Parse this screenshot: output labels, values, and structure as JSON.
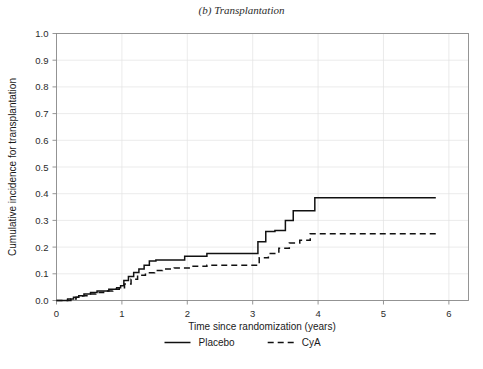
{
  "figure": {
    "title": "(b) Transplantation",
    "background": "#ffffff"
  },
  "chart_data": {
    "type": "line",
    "title": "(b) Transplantation",
    "xlabel": "Time since randomization (years)",
    "ylabel": "Cumulative incidence for transplantation",
    "xlim": [
      0,
      6.3
    ],
    "ylim": [
      0,
      1.0
    ],
    "xticks": [
      0,
      1,
      2,
      3,
      4,
      5,
      6
    ],
    "xtick_labels": [
      "0",
      "1",
      "2",
      "3",
      "4",
      "5",
      "6"
    ],
    "yticks": [
      0.0,
      0.1,
      0.2,
      0.3,
      0.4,
      0.5,
      0.6,
      0.7,
      0.8,
      0.9,
      1.0
    ],
    "ytick_labels": [
      "0.0",
      "0.1",
      "0.2",
      "0.3",
      "0.4",
      "0.5",
      "0.6",
      "0.7",
      "0.8",
      "0.9",
      "1.0"
    ],
    "grid": true,
    "grid_color": "#e3e3e3",
    "legend_position": "bottom",
    "step_type": "post",
    "series": [
      {
        "name": "Placebo",
        "style": "solid",
        "color": "#111111",
        "dasharray": "",
        "x": [
          0.0,
          0.17,
          0.26,
          0.34,
          0.42,
          0.52,
          0.62,
          0.7,
          0.8,
          0.92,
          0.98,
          1.03,
          1.1,
          1.18,
          1.26,
          1.34,
          1.42,
          1.52,
          1.86,
          1.96,
          2.22,
          2.3,
          3.02,
          3.08,
          3.2,
          3.34,
          3.5,
          3.62,
          3.95,
          5.8
        ],
        "y": [
          0.0,
          0.006,
          0.012,
          0.018,
          0.024,
          0.03,
          0.036,
          0.036,
          0.042,
          0.048,
          0.055,
          0.075,
          0.09,
          0.105,
          0.118,
          0.132,
          0.148,
          0.152,
          0.152,
          0.166,
          0.166,
          0.176,
          0.176,
          0.22,
          0.258,
          0.262,
          0.3,
          0.336,
          0.385,
          0.385
        ]
      },
      {
        "name": "CyA",
        "style": "dashed",
        "color": "#111111",
        "dasharray": "6,4",
        "x": [
          0.0,
          0.22,
          0.3,
          0.4,
          0.5,
          0.6,
          0.72,
          0.86,
          0.96,
          1.04,
          1.14,
          1.24,
          1.36,
          1.5,
          1.62,
          1.8,
          2.06,
          2.3,
          3.0,
          3.1,
          3.24,
          3.4,
          3.56,
          3.72,
          3.88,
          5.8
        ],
        "y": [
          0.0,
          0.006,
          0.012,
          0.018,
          0.024,
          0.03,
          0.036,
          0.042,
          0.048,
          0.062,
          0.08,
          0.095,
          0.104,
          0.112,
          0.118,
          0.122,
          0.128,
          0.132,
          0.132,
          0.16,
          0.176,
          0.196,
          0.215,
          0.226,
          0.25,
          0.25
        ]
      }
    ]
  },
  "legend": {
    "items": [
      {
        "label": "Placebo",
        "style": "solid"
      },
      {
        "label": "CyA",
        "style": "dashed"
      }
    ]
  }
}
